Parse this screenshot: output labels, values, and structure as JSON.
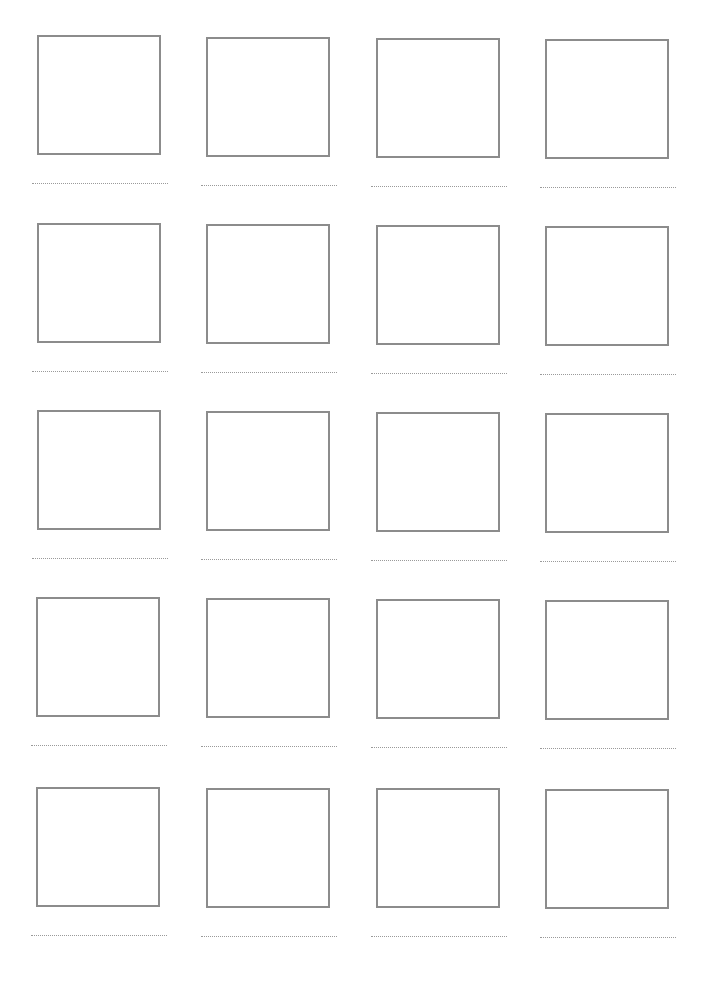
{
  "worksheet": {
    "type": "blank drawing grid with writing lines",
    "columns": 4,
    "rows": 5,
    "box_border_color": "#8c8c8c",
    "line_color": "#9a9a9a",
    "cells": [
      {
        "row": 1,
        "col": 1,
        "x": 32,
        "y": 35
      },
      {
        "row": 1,
        "col": 2,
        "x": 201,
        "y": 37
      },
      {
        "row": 1,
        "col": 3,
        "x": 371,
        "y": 38
      },
      {
        "row": 1,
        "col": 4,
        "x": 540,
        "y": 39
      },
      {
        "row": 2,
        "col": 1,
        "x": 32,
        "y": 223
      },
      {
        "row": 2,
        "col": 2,
        "x": 201,
        "y": 224
      },
      {
        "row": 2,
        "col": 3,
        "x": 371,
        "y": 225
      },
      {
        "row": 2,
        "col": 4,
        "x": 540,
        "y": 226
      },
      {
        "row": 3,
        "col": 1,
        "x": 32,
        "y": 410
      },
      {
        "row": 3,
        "col": 2,
        "x": 201,
        "y": 411
      },
      {
        "row": 3,
        "col": 3,
        "x": 371,
        "y": 412
      },
      {
        "row": 3,
        "col": 4,
        "x": 540,
        "y": 413
      },
      {
        "row": 4,
        "col": 1,
        "x": 31,
        "y": 597
      },
      {
        "row": 4,
        "col": 2,
        "x": 201,
        "y": 598
      },
      {
        "row": 4,
        "col": 3,
        "x": 371,
        "y": 599
      },
      {
        "row": 4,
        "col": 4,
        "x": 540,
        "y": 600
      },
      {
        "row": 5,
        "col": 1,
        "x": 31,
        "y": 787
      },
      {
        "row": 5,
        "col": 2,
        "x": 201,
        "y": 788
      },
      {
        "row": 5,
        "col": 3,
        "x": 371,
        "y": 788
      },
      {
        "row": 5,
        "col": 4,
        "x": 540,
        "y": 789
      }
    ]
  }
}
